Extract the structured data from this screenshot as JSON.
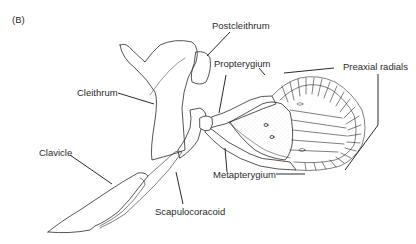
{
  "figure": {
    "panel_label": "(B)",
    "line_color": "#2a2a2a",
    "stipple_color": "#bdbdbd",
    "labels": {
      "postcleithrum": "Postcleithrum",
      "cleithrum": "Cleithrum",
      "propterygium": "Propterygium",
      "preaxial_radials": "Preaxial radials",
      "clavicle": "Clavicle",
      "metapterygium": "Metapterygium",
      "scapulocoracoid": "Scapulocoracoid"
    }
  }
}
